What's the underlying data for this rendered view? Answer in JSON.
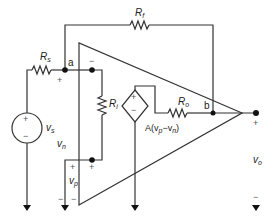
{
  "diagram": {
    "type": "op-amp equivalent circuit (inverting amplifier)",
    "components": {
      "Rs": {
        "label": "R",
        "sub": "s"
      },
      "Rf": {
        "label": "R",
        "sub": "f"
      },
      "Ri": {
        "label": "R",
        "sub": "i"
      },
      "Ro": {
        "label": "R",
        "sub": "o"
      },
      "vs": {
        "label": "v",
        "sub": "s"
      },
      "dependent_source": {
        "label": "A(v",
        "p": "p",
        "mid": "−v",
        "n": "n",
        "close": ")"
      }
    },
    "nodes": {
      "a": "a",
      "b": "b"
    },
    "voltages": {
      "vn": {
        "label": "v",
        "sub": "n"
      },
      "vp": {
        "label": "v",
        "sub": "p"
      },
      "vo": {
        "label": "v",
        "sub": "o"
      }
    },
    "signs": {
      "plus": "+",
      "minus": "−"
    },
    "colors": {
      "wire": "#333333",
      "node": "#111111",
      "sign": "#666666"
    }
  }
}
